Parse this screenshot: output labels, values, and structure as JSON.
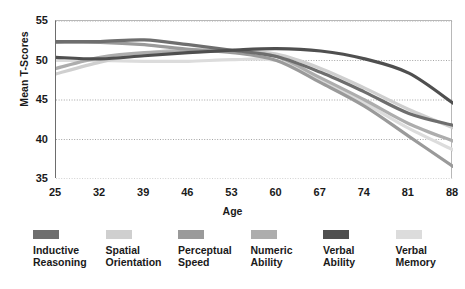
{
  "chart_data": {
    "type": "line",
    "title": "",
    "xlabel": "Age",
    "ylabel": "Mean T-Scores",
    "x": [
      25,
      32,
      39,
      46,
      53,
      60,
      67,
      74,
      81,
      88
    ],
    "xtick_labels": [
      "25",
      "32",
      "39",
      "46",
      "53",
      "60",
      "67",
      "74",
      "81",
      "88"
    ],
    "ytick_labels": [
      "35",
      "40",
      "45",
      "50",
      "55"
    ],
    "yticks": [
      35,
      40,
      45,
      50,
      55
    ],
    "xlim": [
      25,
      88
    ],
    "ylim": [
      35,
      55
    ],
    "grid": "horizontal-dotted",
    "legend_position": "bottom",
    "series": [
      {
        "name": "Inductive Reasoning",
        "label_line1": "Inductive",
        "label_line2": "Reasoning",
        "color": "#6e6e6e",
        "values": [
          52.4,
          52.4,
          52.6,
          52.0,
          51.3,
          50.5,
          48.5,
          46.0,
          43.3,
          41.8
        ]
      },
      {
        "name": "Spatial Orientation",
        "label_line1": "Spatial",
        "label_line2": "Orientation",
        "color": "#cfcfcf",
        "values": [
          48.3,
          49.8,
          50.9,
          51.4,
          51.3,
          50.8,
          49.0,
          46.5,
          43.8,
          41.5
        ]
      },
      {
        "name": "Perceptual Speed",
        "label_line1": "Perceptual",
        "label_line2": "Speed",
        "color": "#9a9a9a",
        "values": [
          52.3,
          52.3,
          52.0,
          51.4,
          51.0,
          50.0,
          47.2,
          44.2,
          40.4,
          36.6
        ]
      },
      {
        "name": "Numeric Ability",
        "label_line1": "Numeric",
        "label_line2": "Ability",
        "color": "#adadad",
        "values": [
          49.0,
          50.4,
          51.0,
          51.1,
          51.2,
          50.5,
          47.8,
          45.0,
          42.0,
          39.8
        ]
      },
      {
        "name": "Verbal Ability",
        "label_line1": "Verbal",
        "label_line2": "Ability",
        "color": "#4f4f4f",
        "values": [
          50.4,
          50.2,
          50.6,
          51.0,
          51.3,
          51.5,
          51.2,
          50.2,
          48.4,
          44.6
        ]
      },
      {
        "name": "Verbal Memory",
        "label_line1": "Verbal",
        "label_line2": "Memory",
        "color": "#dcdcdc",
        "values": [
          50.0,
          50.0,
          49.9,
          49.9,
          50.1,
          50.0,
          47.6,
          44.6,
          41.4,
          38.7
        ]
      }
    ]
  }
}
